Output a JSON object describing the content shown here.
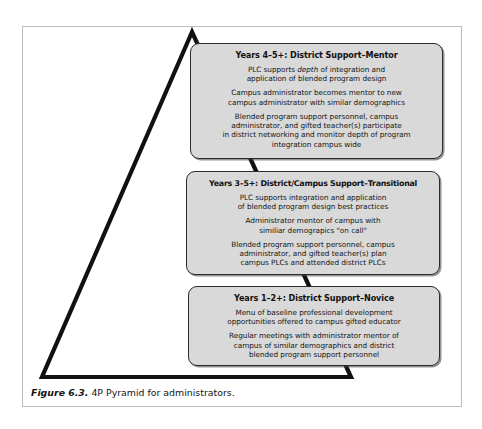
{
  "figure": {
    "caption_label": "Figure 6.3.",
    "caption_text": " 4P Pyramid for administrators.",
    "colors": {
      "box_fill": "#d9d9d9",
      "box_border": "#2b2b2b",
      "pyramid_stroke": "#111111",
      "frame_border": "#bdbdbd",
      "page_background": "#ffffff"
    },
    "shape": {
      "name": "pyramid",
      "apex": [
        192,
        32
      ],
      "base_left": [
        42,
        377
      ],
      "base_right": [
        351,
        377
      ]
    }
  },
  "stages": [
    {
      "id": "mentor",
      "title": "Years 4–5+: District Support–Mentor",
      "paragraphs": [
        {
          "parts": [
            {
              "text": "PLC supports ",
              "italic": false
            },
            {
              "text": "depth",
              "italic": true
            },
            {
              "text": " of integration and",
              "italic": false
            }
          ],
          "line2": "application of blended program design"
        },
        {
          "parts": [
            {
              "text": "Campus administrator becomes mentor to new",
              "italic": false
            }
          ],
          "line2": "campus administrator with similar demographics"
        },
        {
          "parts": [
            {
              "text": "Blended program support personnel, campus",
              "italic": false
            }
          ],
          "line2": "administrator, and gifted teacher(s) participate",
          "line3": "in district networking and monitor depth of program",
          "line4": "integration campus wide"
        }
      ]
    },
    {
      "id": "transitional",
      "title": "Years 3–5+: District/Campus Support–Transitional",
      "paragraphs": [
        {
          "parts": [
            {
              "text": "PLC supports integration and application",
              "italic": false
            }
          ],
          "line2": "of blended program design best practices"
        },
        {
          "parts": [
            {
              "text": "Administrator mentor of campus with",
              "italic": false
            }
          ],
          "line2": "similiar demograpics \"on call\""
        },
        {
          "parts": [
            {
              "text": "Blended program support personnel, campus",
              "italic": false
            }
          ],
          "line2": "administrator, and gifted teacher(s) plan",
          "line3": "campus PLCs and attended district PLCs"
        }
      ]
    },
    {
      "id": "novice",
      "title": "Years 1–2+: District Support–Novice",
      "paragraphs": [
        {
          "parts": [
            {
              "text": "Menu of baseline professional development",
              "italic": false
            }
          ],
          "line2": "opportunities offered to campus gifted educator"
        },
        {
          "parts": [
            {
              "text": "Regular meetings with administrator mentor of",
              "italic": false
            }
          ],
          "line2": "campus of similar demographics and district",
          "line3": "blended program support personnel"
        }
      ]
    }
  ]
}
